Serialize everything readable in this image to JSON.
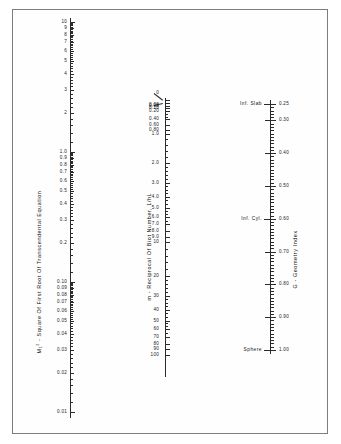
{
  "figure": {
    "background_color": "#ffffff",
    "line_color": "#2b2b2b",
    "text_color": "#111111",
    "border_color": "#7d7d7d"
  },
  "axes": {
    "left": {
      "title": "- Square Of First Root Of Transcendental Equation",
      "title_symbol": "M",
      "title_symbol_sub": "1",
      "title_symbol_sup": "2",
      "scale": "log",
      "min": 0.01,
      "max": 10,
      "labels": [
        "10",
        "9",
        "8",
        "7",
        "6",
        "5",
        "4",
        "3",
        "2",
        "1.0",
        "0.9",
        "0.8",
        "0.7",
        "0.6",
        "0.5",
        "0.4",
        "0.3",
        "0.2",
        "0.10",
        "0.09",
        "0.08",
        "0.07",
        "0.06",
        "0.05",
        "0.04",
        "0.03",
        "0.02",
        "0.01"
      ],
      "values": [
        10,
        9,
        8,
        7,
        6,
        5,
        4,
        3,
        2,
        1.0,
        0.9,
        0.8,
        0.7,
        0.6,
        0.5,
        0.4,
        0.3,
        0.2,
        0.1,
        0.09,
        0.08,
        0.07,
        0.06,
        0.05,
        0.04,
        0.03,
        0.02,
        0.01
      ]
    },
    "middle": {
      "title": "m - Reciprocal Of Biot Number, 1/hL",
      "scale": "log-like",
      "min": 0,
      "max": 100,
      "labels": [
        "0",
        "0.02",
        "0.05",
        "0.10",
        "0.20",
        "0.40",
        "0.60",
        "0.80",
        "1.0",
        "2.0",
        "3.0",
        "4.0",
        "5.0",
        "6.0",
        "7.0",
        "8.0",
        "9.0",
        "10",
        "20",
        "30",
        "40",
        "50",
        "60",
        "70",
        "80",
        "90",
        "100"
      ],
      "values": [
        0,
        0.02,
        0.05,
        0.1,
        0.2,
        0.4,
        0.6,
        0.8,
        1.0,
        2.0,
        3.0,
        4.0,
        5.0,
        6.0,
        7.0,
        8.0,
        9.0,
        10,
        20,
        30,
        40,
        50,
        60,
        70,
        80,
        90,
        100
      ]
    },
    "right": {
      "title": "G - Geometry Index",
      "scale": "linear",
      "min": 0.25,
      "max": 1.0,
      "labels": [
        "0.25",
        "0.30",
        "0.40",
        "0.50",
        "0.60",
        "0.70",
        "0.80",
        "0.90",
        "1.00"
      ],
      "values": [
        0.25,
        0.3,
        0.4,
        0.5,
        0.6,
        0.7,
        0.8,
        0.9,
        1.0
      ],
      "markers": [
        {
          "label": "Inf. Slab",
          "value": 0.25
        },
        {
          "label": "Inf. Cyl.",
          "value": 0.6
        },
        {
          "label": "Sphere",
          "value": 1.0
        }
      ]
    }
  },
  "chart_data": {
    "type": "nomograph",
    "title": "",
    "axis_count": 3,
    "series": [
      {
        "name": "M1^2 - Square Of First Root Of Transcendental Equation",
        "orientation": "vertical",
        "position": "left",
        "scale": "logarithmic",
        "range": [
          0.01,
          10
        ],
        "tick_values": [
          10,
          9,
          8,
          7,
          6,
          5,
          4,
          3,
          2,
          1.0,
          0.9,
          0.8,
          0.7,
          0.6,
          0.5,
          0.4,
          0.3,
          0.2,
          0.1,
          0.09,
          0.08,
          0.07,
          0.06,
          0.05,
          0.04,
          0.03,
          0.02,
          0.01
        ],
        "tick_labels": [
          "10",
          "9",
          "8",
          "7",
          "6",
          "5",
          "4",
          "3",
          "2",
          "1.0",
          "0.9",
          "0.8",
          "0.7",
          "0.6",
          "0.5",
          "0.4",
          "0.3",
          "0.2",
          "0.10",
          "0.09",
          "0.08",
          "0.07",
          "0.06",
          "0.05",
          "0.04",
          "0.03",
          "0.02",
          "0.01"
        ]
      },
      {
        "name": "m - Reciprocal Of Biot Number, 1/hL",
        "orientation": "vertical",
        "position": "middle",
        "scale": "logarithmic-compressed",
        "range": [
          0,
          100
        ],
        "tick_values": [
          0,
          0.02,
          0.05,
          0.1,
          0.2,
          0.4,
          0.6,
          0.8,
          1.0,
          2.0,
          3.0,
          4.0,
          5.0,
          6.0,
          7.0,
          8.0,
          9.0,
          10,
          20,
          30,
          40,
          50,
          60,
          70,
          80,
          90,
          100
        ],
        "tick_labels": [
          "0",
          "0.02",
          "0.05",
          "0.10",
          "0.20",
          "0.40",
          "0.60",
          "0.80",
          "1.0",
          "2.0",
          "3.0",
          "4.0",
          "5.0",
          "6.0",
          "7.0",
          "8.0",
          "9.0",
          "10",
          "20",
          "30",
          "40",
          "50",
          "60",
          "70",
          "80",
          "90",
          "100"
        ]
      },
      {
        "name": "G - Geometry Index",
        "orientation": "vertical",
        "position": "right",
        "scale": "linear",
        "range": [
          0.25,
          1.0
        ],
        "tick_values": [
          0.25,
          0.3,
          0.4,
          0.5,
          0.6,
          0.7,
          0.8,
          0.9,
          1.0
        ],
        "tick_labels": [
          "0.25",
          "0.30",
          "0.40",
          "0.50",
          "0.60",
          "0.70",
          "0.80",
          "0.90",
          "1.00"
        ],
        "annotations": [
          "Inf. Slab",
          "Inf. Cyl.",
          "Sphere"
        ]
      }
    ],
    "grid": false,
    "legend": "none"
  }
}
